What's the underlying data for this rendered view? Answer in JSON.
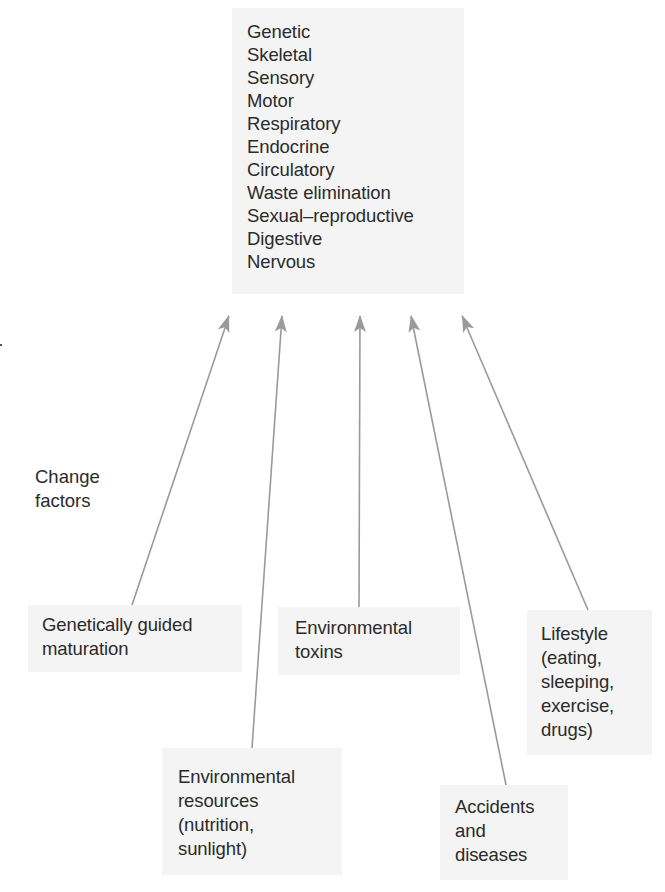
{
  "systems": {
    "items": [
      "Genetic",
      "Skeletal",
      "Sensory",
      "Motor",
      "Respiratory",
      "Endocrine",
      "Circulatory",
      "Waste elimination",
      "Sexual–reproductive",
      "Digestive",
      "Nervous"
    ]
  },
  "label": {
    "line1": "Change",
    "line2": "factors"
  },
  "factors": [
    {
      "lines": [
        "Genetically guided",
        "maturation"
      ]
    },
    {
      "lines": [
        "Environmental",
        "resources",
        "(nutrition,",
        "sunlight)"
      ]
    },
    {
      "lines": [
        "Environmental",
        "toxins"
      ]
    },
    {
      "lines": [
        "Accidents",
        "and",
        "diseases"
      ]
    },
    {
      "lines": [
        "Lifestyle",
        "(eating,",
        "sleeping,",
        "exercise,",
        "drugs)"
      ]
    }
  ],
  "colors": {
    "box_fill": "#f4f4f4",
    "arrow": "#9a9a9a",
    "text": "#2b2b2b"
  }
}
